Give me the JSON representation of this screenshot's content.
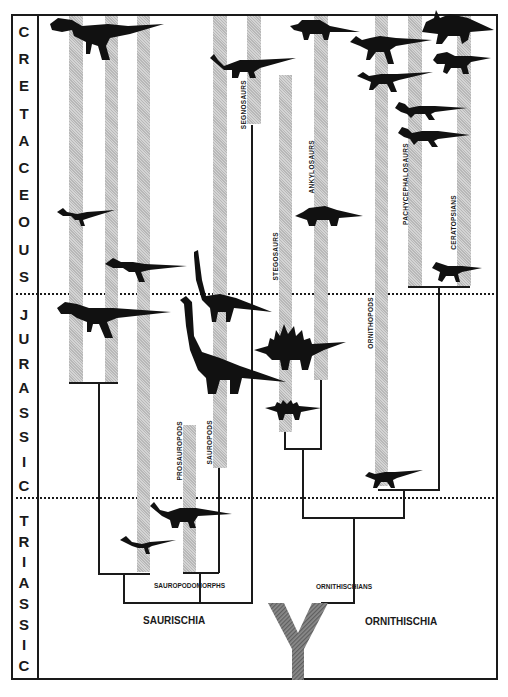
{
  "diagram": {
    "type": "phylogenetic-tree",
    "periods": [
      {
        "name": "CRETACEOUS",
        "letters": [
          "C",
          "R",
          "E",
          "T",
          "A",
          "C",
          "E",
          "O",
          "U",
          "S"
        ]
      },
      {
        "name": "JURASSIC",
        "letters": [
          "J",
          "U",
          "R",
          "A",
          "S",
          "S",
          "I",
          "C"
        ]
      },
      {
        "name": "TRIASSIC",
        "letters": [
          "T",
          "R",
          "I",
          "A",
          "S",
          "S",
          "I",
          "C"
        ]
      }
    ],
    "groups": {
      "segnosaurs": "SEGNOSAURS",
      "ankylosaurs": "ANKYLOSAURS",
      "stegosaurs": "STEGOSAURS",
      "ornithopods": "ORNITHOPODS",
      "pachycephalosaurs": "PACHYCEPHALOSAURS",
      "ceratopsians": "CERATOPSIANS",
      "prosauropods": "PROSAUROPODS",
      "sauropods": "SAUROPODS"
    },
    "clades": {
      "sauropodomorphs": "SAUROPODOMORPHS",
      "ornithischians": "ORNITHISCHIANS",
      "saurischia": "SAURISCHIA",
      "ornithischia": "ORNITHISCHIA"
    },
    "root_glyph": "Y",
    "colors": {
      "ink": "#1a1a1a",
      "bar": "#c8c8c8",
      "background": "#ffffff"
    }
  }
}
